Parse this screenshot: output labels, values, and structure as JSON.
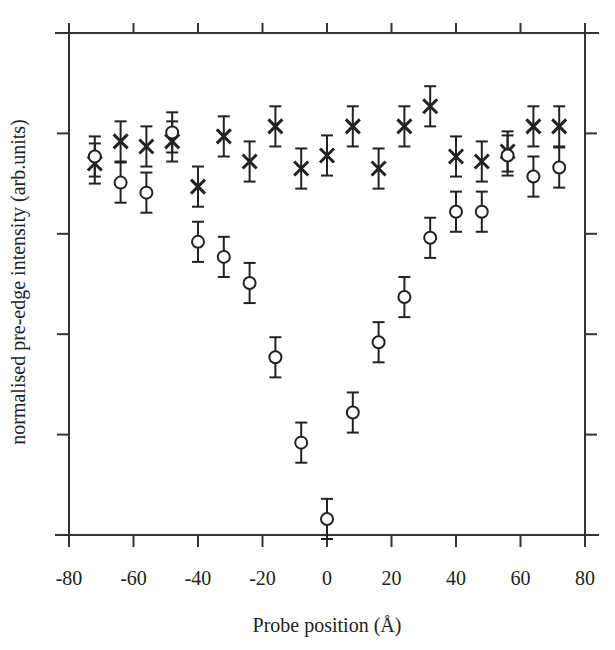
{
  "chart_data": {
    "type": "scatter",
    "title": "",
    "xlabel": "Probe position (Å)",
    "ylabel": "normalised pre-edge intensity (arb.units)",
    "xlim": [
      -80,
      80
    ],
    "ylim": [
      0,
      5
    ],
    "x_ticks": [
      -80,
      -60,
      -40,
      -20,
      0,
      20,
      40,
      60,
      80
    ],
    "x_tick_labels": [
      "-80",
      "-60",
      "-40",
      "-20",
      "0",
      "20",
      "40",
      "60",
      "80"
    ],
    "y_ticks": [
      1,
      2,
      3,
      4
    ],
    "y_tick_labels": [],
    "grid": false,
    "legend": null,
    "x": [
      -72,
      -64,
      -56,
      -48,
      -40,
      -32,
      -24,
      -16,
      -8,
      0,
      8,
      16,
      24,
      32,
      40,
      48,
      56,
      64,
      72
    ],
    "series": [
      {
        "name": "cross",
        "marker": "x",
        "values": [
          3.7,
          3.92,
          3.87,
          3.92,
          3.47,
          3.97,
          3.72,
          4.07,
          3.65,
          3.78,
          4.07,
          3.65,
          4.07,
          4.27,
          3.77,
          3.72,
          3.82,
          4.07,
          4.07
        ],
        "errors": [
          0.2,
          0.2,
          0.2,
          0.2,
          0.2,
          0.2,
          0.2,
          0.2,
          0.2,
          0.2,
          0.2,
          0.2,
          0.2,
          0.2,
          0.2,
          0.2,
          0.2,
          0.2,
          0.2
        ]
      },
      {
        "name": "circle",
        "marker": "o",
        "values": [
          3.77,
          3.51,
          3.41,
          4.01,
          2.92,
          2.77,
          2.51,
          1.77,
          0.92,
          0.16,
          1.22,
          1.92,
          2.37,
          2.96,
          3.22,
          3.22,
          3.78,
          3.57,
          3.66
        ],
        "errors": [
          0.2,
          0.2,
          0.2,
          0.2,
          0.2,
          0.2,
          0.2,
          0.2,
          0.2,
          0.2,
          0.2,
          0.2,
          0.2,
          0.2,
          0.2,
          0.2,
          0.2,
          0.2,
          0.2
        ]
      }
    ]
  }
}
